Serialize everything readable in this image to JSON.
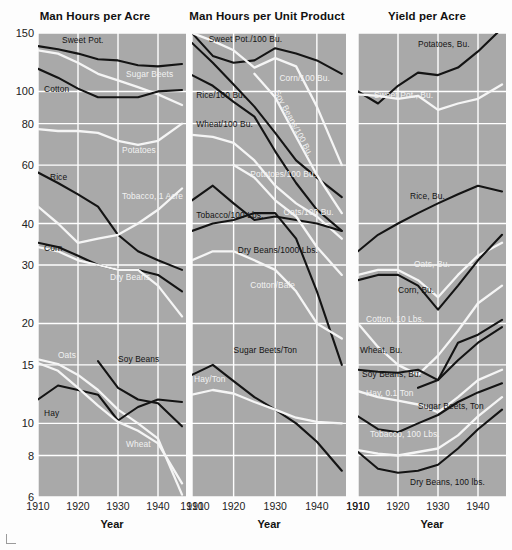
{
  "figure": {
    "xlabel": "Year",
    "xticks": [
      1910,
      1920,
      1930,
      1940
    ],
    "yticks": [
      150,
      100,
      80,
      60,
      40,
      30,
      20,
      15,
      10,
      8,
      6
    ],
    "ylim": [
      6,
      150
    ],
    "xlim": [
      1910,
      1947
    ],
    "scale": "log",
    "background_color": "#a9a9a9",
    "gridline_color": "#ffffff",
    "dark_series_color": "#141414",
    "light_series_color": "#f5f5f5"
  },
  "chart_data": [
    {
      "type": "line",
      "title": "Man Hours per Acre",
      "xlabel": "Year",
      "ylabel": "",
      "ylim": [
        6,
        150
      ],
      "xlim": [
        1910,
        1947
      ],
      "yscale": "log",
      "yticks": [
        150,
        100,
        80,
        60,
        40,
        30,
        20,
        15,
        10,
        8,
        6
      ],
      "xticks": [
        1910,
        1920,
        1930,
        1940
      ],
      "grid": true,
      "legend": "inline-labels",
      "x": [
        1910,
        1915,
        1920,
        1925,
        1930,
        1935,
        1940,
        1946
      ],
      "series": [
        {
          "name": "Sweet Pot.",
          "color": "dark",
          "label_x": 1916,
          "label_y": 142,
          "values": [
            137,
            134,
            130,
            125,
            124,
            120,
            119,
            121
          ]
        },
        {
          "name": "Sugar Beets",
          "color": "light",
          "label_x": 1932,
          "label_y": 112,
          "values": [
            133,
            130,
            122,
            113,
            108,
            103,
            98,
            91
          ]
        },
        {
          "name": "Cotton",
          "color": "dark",
          "label_x": 1911.5,
          "label_y": 101,
          "values": [
            117,
            110,
            102,
            96,
            96,
            96,
            100,
            101
          ]
        },
        {
          "name": "Potatoes",
          "color": "light",
          "label_x": 1931,
          "label_y": 66,
          "values": [
            77,
            76,
            76,
            75,
            71,
            69,
            71,
            80
          ]
        },
        {
          "name": "Rice",
          "color": "dark",
          "label_x": 1913,
          "label_y": 55,
          "values": [
            57,
            53,
            49,
            45,
            37,
            33,
            31,
            29
          ]
        },
        {
          "name": "Tobacco, 1 Acre",
          "color": "light",
          "label_x": 1931,
          "label_y": 48,
          "values": [
            45,
            40,
            35,
            36,
            37,
            40,
            44,
            51
          ]
        },
        {
          "name": "Corn",
          "color": "dark",
          "label_x": 1911.5,
          "label_y": 33.5,
          "values": [
            35,
            34,
            32,
            30,
            29,
            29,
            28,
            25
          ]
        },
        {
          "name": "Dry Beans",
          "color": "light",
          "label_x": 1928,
          "label_y": 27.5,
          "values": [
            34,
            33,
            31,
            30,
            29,
            29,
            26,
            21
          ]
        },
        {
          "name": "Oats",
          "color": "light",
          "label_x": 1915,
          "label_y": 16,
          "values": [
            15.6,
            15.1,
            14.0,
            12.6,
            11.0,
            10.0,
            9.0,
            6.1
          ]
        },
        {
          "name": "Hay",
          "color": "dark",
          "label_x": 1911.5,
          "label_y": 10.7,
          "values": [
            11.8,
            13.0,
            12.6,
            12.2,
            10.2,
            11.2,
            11.8,
            11.6
          ]
        },
        {
          "name": "Soy Beans",
          "color": "dark",
          "label_x": 1930,
          "label_y": 15.5,
          "values": [
            null,
            null,
            null,
            15.4,
            12.8,
            11.8,
            11.5,
            9.8
          ]
        },
        {
          "name": "Wheat",
          "color": "light",
          "label_x": 1932,
          "label_y": 8.6,
          "values": [
            15.2,
            14.4,
            12.8,
            11.3,
            10.1,
            9.5,
            8.7,
            6.6
          ]
        }
      ]
    },
    {
      "type": "line",
      "title": "Man Hours per Unit Product",
      "xlabel": "Year",
      "ylabel": "",
      "ylim": [
        6,
        150
      ],
      "xlim": [
        1910,
        1947
      ],
      "yscale": "log",
      "grid": true,
      "x": [
        1910,
        1915,
        1920,
        1925,
        1930,
        1935,
        1940,
        1946
      ],
      "series": [
        {
          "name": "Sweet Pot./100 Bu.",
          "color": "dark",
          "label_x": 1914,
          "label_y": 143,
          "values": [
            150,
            128,
            122,
            124,
            135,
            130,
            124,
            113
          ]
        },
        {
          "name": "Corn/100 Bu.",
          "color": "light",
          "label_x": 1931,
          "label_y": 109,
          "values": [
            150,
            142,
            133,
            118,
            126,
            119,
            90,
            60
          ]
        },
        {
          "name": "Rice/100 Bu.",
          "color": "dark",
          "label_x": 1911,
          "label_y": 97,
          "values": [
            140,
            122,
            105,
            90,
            75,
            62,
            55,
            48
          ]
        },
        {
          "name": "Soy Beans/100 Bu.",
          "color": "light",
          "label_x": 1931.5,
          "label_y": 98,
          "values": [
            null,
            null,
            null,
            113,
            96,
            73,
            56,
            43
          ]
        },
        {
          "name": "Wheat/100 Bu.",
          "color": "dark",
          "label_x": 1911,
          "label_y": 79,
          "values": [
            112,
            104,
            93,
            84,
            66,
            53,
            44,
            38
          ]
        },
        {
          "name": "Potatoes/100 Bu.",
          "color": "light",
          "label_x": 1924,
          "label_y": 56,
          "values": [
            74,
            73,
            70,
            62,
            52,
            46,
            42,
            36
          ]
        },
        {
          "name": "Tobacco/100 Lbs.",
          "color": "dark",
          "label_x": 1911,
          "label_y": 42,
          "values": [
            47,
            52,
            46,
            41,
            42,
            41,
            40,
            38
          ]
        },
        {
          "name": "Oats/100 Bu.",
          "color": "light",
          "label_x": 1932,
          "label_y": 43,
          "values": [
            null,
            null,
            60,
            55,
            47,
            42,
            34,
            28
          ]
        },
        {
          "name": "Dry Beans/1000 Lbs.",
          "color": "dark",
          "label_x": 1921,
          "label_y": 33,
          "values": [
            38,
            40,
            41,
            43,
            43,
            36,
            25,
            15
          ]
        },
        {
          "name": "Cotton/Bale",
          "color": "light",
          "label_x": 1924,
          "label_y": 26,
          "values": [
            31,
            33,
            33,
            31,
            29,
            25,
            20,
            18
          ]
        },
        {
          "name": "Sugar Beets/Ton",
          "color": "dark",
          "label_x": 1920,
          "label_y": 16.5,
          "values": [
            14.0,
            15.0,
            13.4,
            12.0,
            11.0,
            10.0,
            8.8,
            7.2
          ]
        },
        {
          "name": "Hay/Ton",
          "color": "light",
          "label_x": 1910.5,
          "label_y": 13.5,
          "values": [
            12.2,
            12.6,
            12.3,
            11.6,
            11.0,
            10.4,
            10.1,
            10.0
          ]
        }
      ]
    },
    {
      "type": "line",
      "title": "Yield per Acre",
      "xlabel": "Year",
      "ylabel": "",
      "ylim": [
        6,
        150
      ],
      "xlim": [
        1910,
        1947
      ],
      "yscale": "log",
      "grid": true,
      "x": [
        1910,
        1915,
        1920,
        1925,
        1930,
        1935,
        1940,
        1946
      ],
      "series": [
        {
          "name": "Potatoes, Bu.",
          "color": "dark",
          "label_x": 1925,
          "label_y": 138,
          "values": [
            100,
            92,
            104,
            114,
            112,
            118,
            132,
            155
          ]
        },
        {
          "name": "Sweet Pot., Bu.",
          "color": "light",
          "label_x": 1914,
          "label_y": 97,
          "values": [
            98,
            97,
            95,
            97,
            88,
            92,
            95,
            105
          ]
        },
        {
          "name": "Rice, Bu.",
          "color": "dark",
          "label_x": 1923,
          "label_y": 48,
          "values": [
            33,
            37,
            40,
            43,
            46,
            49,
            52,
            50
          ]
        },
        {
          "name": "Oats, Bu.",
          "color": "light",
          "label_x": 1924,
          "label_y": 30,
          "values": [
            28,
            29,
            29,
            27,
            24,
            28,
            32,
            35
          ]
        },
        {
          "name": "Corn, Bu.",
          "color": "dark",
          "label_x": 1920,
          "label_y": 25,
          "values": [
            27,
            28,
            28,
            26,
            22,
            26,
            31,
            37
          ]
        },
        {
          "name": "Cotton, 10 Lbs.",
          "color": "light",
          "label_x": 1912,
          "label_y": 20.5,
          "values": [
            20,
            17,
            15,
            14,
            16,
            19,
            23,
            26
          ]
        },
        {
          "name": "Wheat, Bu.",
          "color": "dark",
          "label_x": 1910.5,
          "label_y": 16.5,
          "values": [
            14.5,
            14.3,
            14.2,
            14.5,
            13.5,
            17.5,
            18.5,
            20.5
          ]
        },
        {
          "name": "Soy Beans, Bu.",
          "color": "dark",
          "label_x": 1911,
          "label_y": 14,
          "values": [
            null,
            null,
            null,
            12.8,
            13.5,
            15.5,
            17.5,
            19.5
          ]
        },
        {
          "name": "Hay, 0.1 Ton",
          "color": "light",
          "label_x": 1912,
          "label_y": 12.3,
          "values": [
            12.5,
            12.0,
            11.7,
            11.4,
            10.8,
            12.0,
            13.5,
            14.5
          ]
        },
        {
          "name": "Sugar Beets, Ton",
          "color": "dark",
          "label_x": 1925,
          "label_y": 11.2,
          "values": [
            10.5,
            9.6,
            9.4,
            10.0,
            10.6,
            11.6,
            12.4,
            13.2
          ]
        },
        {
          "name": "Tobacco, 100 Lbs.",
          "color": "light",
          "label_x": 1913,
          "label_y": 9.2,
          "values": [
            8.3,
            8.1,
            8.0,
            8.2,
            8.4,
            9.2,
            10.5,
            12.0
          ]
        },
        {
          "name": "Dry Beans, 100 lbs.",
          "color": "dark",
          "label_x": 1923,
          "label_y": 6.6,
          "values": [
            8.2,
            7.3,
            7.1,
            7.2,
            7.5,
            8.4,
            9.6,
            11.0
          ]
        }
      ]
    }
  ]
}
